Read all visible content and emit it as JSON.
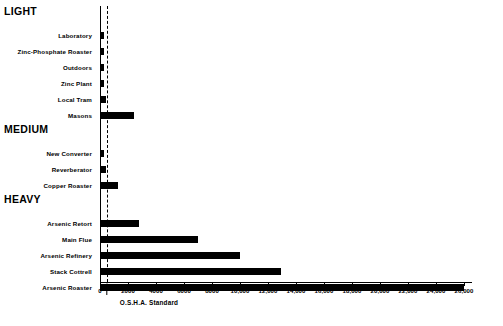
{
  "chart_data": {
    "type": "bar",
    "orientation": "horizontal",
    "title": "",
    "xlabel": "",
    "ylabel": "",
    "xlim": [
      0,
      27000
    ],
    "grid": false,
    "legend": null,
    "xticks": [
      0,
      2000,
      4000,
      6000,
      8000,
      10000,
      12000,
      14000,
      16000,
      18000,
      20000,
      22000,
      24000,
      26000
    ],
    "xticklabels": [
      "0",
      "2000",
      "4000",
      "6000",
      "8000",
      "10,000",
      "12,000",
      "14,000",
      "16,000",
      "18,000",
      "20,000",
      "22,000",
      "24,000",
      "26,000"
    ],
    "annotations": [
      {
        "label": "O.S.H.A. Standard",
        "value": 500,
        "style": "dashed-vertical-line-with-arrow"
      }
    ],
    "groups": [
      {
        "name": "LIGHT",
        "categories": [
          "Laboratory",
          "Zinc-Phosphate Roaster",
          "Outdoors",
          "Zinc Plant",
          "Local Tram",
          "Masons"
        ],
        "values": [
          300,
          300,
          300,
          300,
          450,
          2400
        ]
      },
      {
        "name": "MEDIUM",
        "categories": [
          "New Converter",
          "Reverberator",
          "Copper Roaster"
        ],
        "values": [
          250,
          400,
          1300
        ]
      },
      {
        "name": "HEAVY",
        "categories": [
          "Arsenic Retort",
          "Main Flue",
          "Arsenic Refinery",
          "Stack Cottrell",
          "Arsenic Roaster"
        ],
        "values": [
          2800,
          7000,
          10000,
          12900,
          26000
        ]
      }
    ]
  },
  "colors": {
    "bar": "#000000",
    "axis": "#000000",
    "background": "#ffffff"
  }
}
